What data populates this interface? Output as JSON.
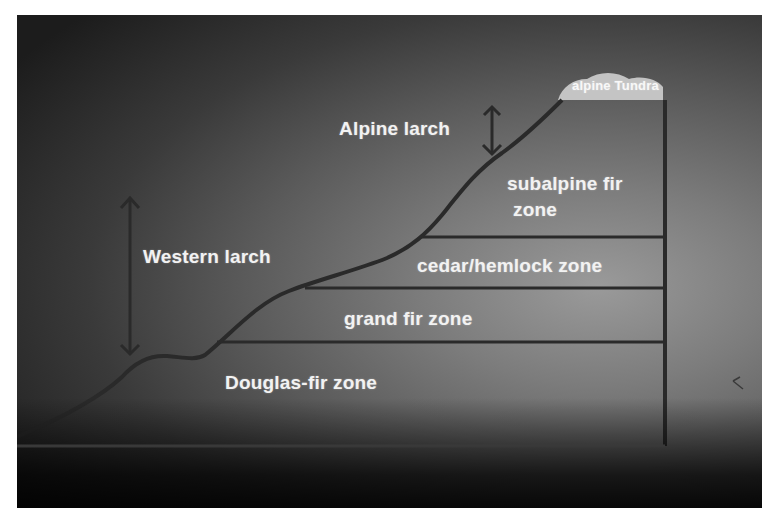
{
  "diagram": {
    "title": "",
    "zones": [
      {
        "label": "alpine Tundra"
      },
      {
        "label_line1": "subalpine fir",
        "label_line2": "zone"
      },
      {
        "label": "cedar/hemlock zone"
      },
      {
        "label": "grand fir zone"
      },
      {
        "label": "Douglas-fir zone"
      }
    ],
    "species_ranges": [
      {
        "label": "Alpine larch",
        "arrow": "double-headed vertical"
      },
      {
        "label": "Western larch",
        "arrow": "double-headed vertical"
      }
    ],
    "colors": {
      "background_dark": "#1c1c1c",
      "background_light": "#9a9a9a",
      "line": "#2a2a2a",
      "text": "#f2f2f2",
      "tundra_patch": "#cfcfcf"
    }
  }
}
